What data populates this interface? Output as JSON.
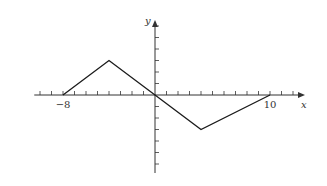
{
  "chart_data": {
    "type": "line",
    "title": "",
    "xlabel": "x",
    "ylabel": "y",
    "x": [
      -8,
      -4,
      0,
      4,
      10
    ],
    "series": [
      {
        "name": "f(x)",
        "values": [
          0,
          3,
          0,
          -3,
          0
        ]
      }
    ],
    "tick_labels": {
      "x": [
        "-8",
        "10"
      ],
      "y": []
    },
    "xlim": [
      -11,
      13
    ],
    "ylim": [
      -6,
      6
    ],
    "x_tick_step": 1,
    "y_tick_step": 1,
    "grid": false,
    "legend": "none"
  },
  "style": {
    "line_color": "#1a1a1a",
    "axis_color": "#333333",
    "origin_px": [
      155,
      95
    ],
    "unit_px": 11.5
  }
}
